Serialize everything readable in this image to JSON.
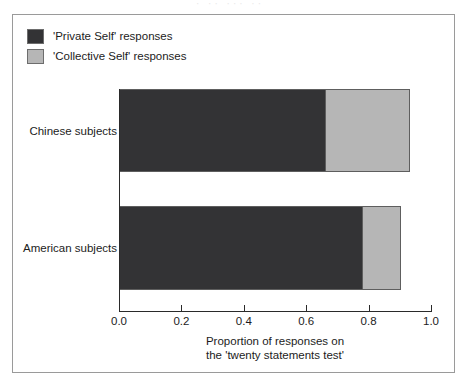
{
  "page": {
    "top_artifact_text": "· ·· ··· ··"
  },
  "legend": {
    "items": [
      {
        "label": "'Private Self' responses",
        "swatch": "private",
        "color": "#333335"
      },
      {
        "label": "'Collective Self' responses",
        "swatch": "collective",
        "color": "#b6b6b6"
      }
    ]
  },
  "chart_data": {
    "type": "bar",
    "orientation": "horizontal",
    "stacked": true,
    "title": "",
    "subtitle": "",
    "categories": [
      "Chinese subjects",
      "American subjects"
    ],
    "series": [
      {
        "name": "'Private Self' responses",
        "color": "#333335",
        "values": [
          0.66,
          0.78
        ]
      },
      {
        "name": "'Collective Self' responses",
        "color": "#b6b6b6",
        "values": [
          0.27,
          0.12
        ]
      }
    ],
    "cumulative_ends": [
      0.93,
      0.9
    ],
    "xlabel": "Proportion of responses on the 'twenty statements test'",
    "xlabel_lines": [
      "Proportion of responses on",
      "the 'twenty statements test'"
    ],
    "ylabel": "",
    "xlim": [
      0.0,
      1.0
    ],
    "xticks": [
      0.0,
      0.2,
      0.4,
      0.6,
      0.8,
      1.0
    ],
    "xtick_labels": [
      "0.0",
      "0.2",
      "0.4",
      "0.6",
      "0.8",
      "1.0"
    ],
    "grid": false,
    "legend_position": "top-left"
  }
}
